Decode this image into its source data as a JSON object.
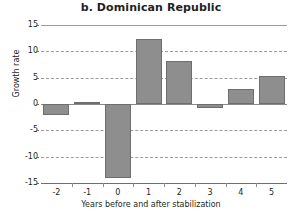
{
  "chart_data": {
    "type": "bar",
    "title": "b. Dominican Republic",
    "xlabel": "Years before and after stabilization",
    "ylabel": "Growth rate",
    "categories": [
      "-2",
      "-1",
      "0",
      "1",
      "2",
      "3",
      "4",
      "5"
    ],
    "values": [
      -2.0,
      0.3,
      -14.0,
      12.3,
      8.2,
      -0.8,
      2.9,
      5.3
    ],
    "ylim": [
      -15,
      15
    ],
    "yticks": [
      "15",
      "10",
      "5",
      "0",
      "-5",
      "-10",
      "-15"
    ],
    "ytick_values": [
      15,
      10,
      5,
      0,
      -5,
      -10,
      -15
    ],
    "grid": true,
    "legend": "none",
    "bar_color": "#8e8e8e",
    "bar_border_color": "#6e6e6e",
    "grid_color": "#9b9b9b",
    "axis_color": "#6f6f6f",
    "text_color": "#231f20",
    "background": "#ffffff"
  }
}
